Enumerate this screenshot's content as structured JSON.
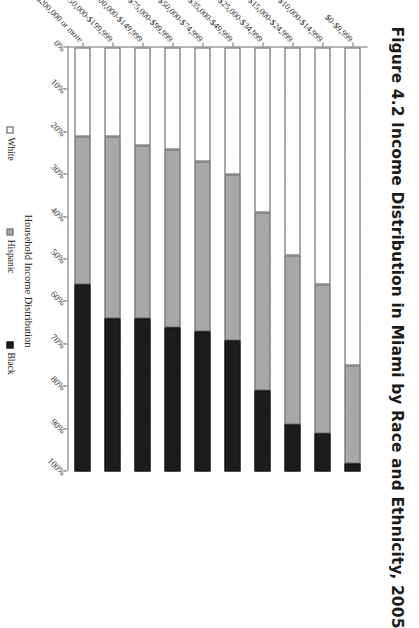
{
  "figure": {
    "title": "Figure 4.2  Income Distribution in Miami by Race and Ethnicity, 2005",
    "orientation": "page-rotated-90-clockwise"
  },
  "legend": {
    "position": "bottom",
    "items": [
      {
        "label": "White",
        "swatch": "open-square-swatch",
        "color": "#ffffff"
      },
      {
        "label": "Hispanic",
        "swatch": "gray-square-swatch",
        "color": "#a8a8a8"
      },
      {
        "label": "Black",
        "swatch": "black-square-swatch",
        "color": "#1c1c1c"
      }
    ]
  },
  "axes": {
    "category_title": "Household Income Distribution",
    "value_ticks": [
      "0%",
      "10%",
      "20%",
      "30%",
      "40%",
      "50%",
      "60%",
      "70%",
      "80%",
      "90%",
      "100%"
    ]
  },
  "chart_data": {
    "type": "bar",
    "title": "Figure 4.2  Income Distribution in Miami by Race and Ethnicity, 2005",
    "subtitle": "",
    "xlabel": "Household Income Distribution",
    "ylabel": "",
    "ylim": [
      0,
      100
    ],
    "grid": false,
    "stacked": true,
    "normalized_percent": true,
    "legend_position": "bottom",
    "categories": [
      "$0-$9,999",
      "$10,000-$14,999",
      "$15,000-$24,999",
      "$25,000-$34,999",
      "$35,000-$49,999",
      "$50,000-$74,999",
      "$75,000-$99,999",
      "$100,000-$149,999",
      "$150,000-$199,999",
      "$200,000 or more"
    ],
    "series": [
      {
        "name": "White",
        "color": "#ffffff",
        "values": [
          21,
          21,
          23,
          24,
          27,
          30,
          39,
          49,
          56,
          75
        ]
      },
      {
        "name": "Hispanic",
        "color": "#a8a8a8",
        "values": [
          35,
          43,
          41,
          42,
          40,
          39,
          42,
          40,
          35,
          23
        ]
      },
      {
        "name": "Black",
        "color": "#1c1c1c",
        "values": [
          44,
          36,
          36,
          34,
          33,
          31,
          19,
          11,
          9,
          2
        ]
      }
    ],
    "tick_labels": [
      "0%",
      "10%",
      "20%",
      "30%",
      "40%",
      "50%",
      "60%",
      "70%",
      "80%",
      "90%",
      "100%"
    ]
  }
}
